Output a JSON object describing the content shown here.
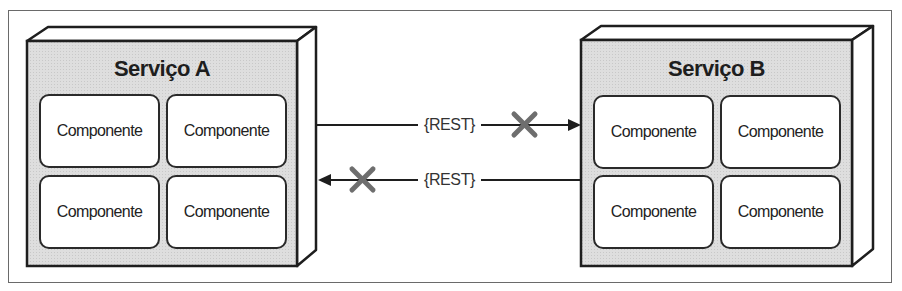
{
  "diagram": {
    "services": [
      {
        "name": "Serviço A",
        "components": [
          "Componente",
          "Componente",
          "Componente",
          "Componente"
        ]
      },
      {
        "name": "Serviço B",
        "components": [
          "Componente",
          "Componente",
          "Componente",
          "Componente"
        ]
      }
    ],
    "connections": [
      {
        "label": "{REST}",
        "from": "Serviço A",
        "to": "Serviço B",
        "blocked": true
      },
      {
        "label": "{REST}",
        "from": "Serviço B",
        "to": "Serviço A",
        "blocked": true
      }
    ],
    "colors": {
      "service_fill": "#dcdcdc",
      "outline": "#1e1e1e",
      "blocked_x": "#6e6e6e",
      "frame": "#6a6a6a"
    }
  }
}
